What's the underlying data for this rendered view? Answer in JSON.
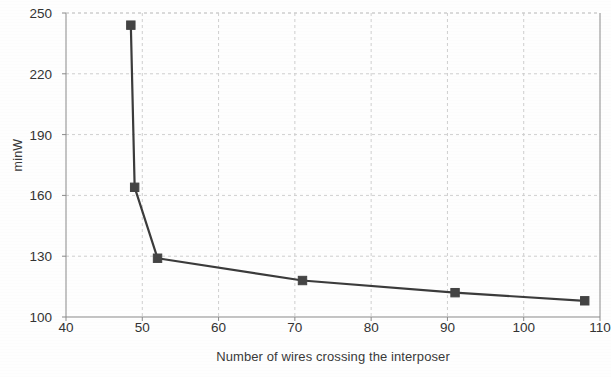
{
  "chart_data": {
    "type": "line",
    "title": "",
    "subtitle": "",
    "xlabel": "Number of wires crossing the interposer",
    "ylabel": "minW",
    "xlim": [
      40,
      110
    ],
    "ylim": [
      100,
      250
    ],
    "xticks": [
      40,
      50,
      60,
      70,
      80,
      90,
      100,
      110
    ],
    "yticks": [
      100,
      130,
      160,
      190,
      220,
      250
    ],
    "grid": true,
    "legend": null,
    "series": [
      {
        "name": "minW",
        "marker": "square",
        "color": "#3b3b3b",
        "x": [
          48.5,
          49,
          52,
          71,
          91,
          108
        ],
        "y": [
          244,
          164,
          129,
          118,
          112,
          108
        ],
        "points": [
          {
            "x": 48.5,
            "y": 244
          },
          {
            "x": 49,
            "y": 164
          },
          {
            "x": 52,
            "y": 129
          },
          {
            "x": 71,
            "y": 118
          },
          {
            "x": 91,
            "y": 112
          },
          {
            "x": 108,
            "y": 108
          }
        ]
      }
    ]
  },
  "style": {
    "line_color": "#3b3b3b",
    "marker_color": "#444444",
    "grid_color": "#cfcfcf",
    "axis_color": "#8a8a8a",
    "background": "#fefefe",
    "text_color": "#333333"
  }
}
